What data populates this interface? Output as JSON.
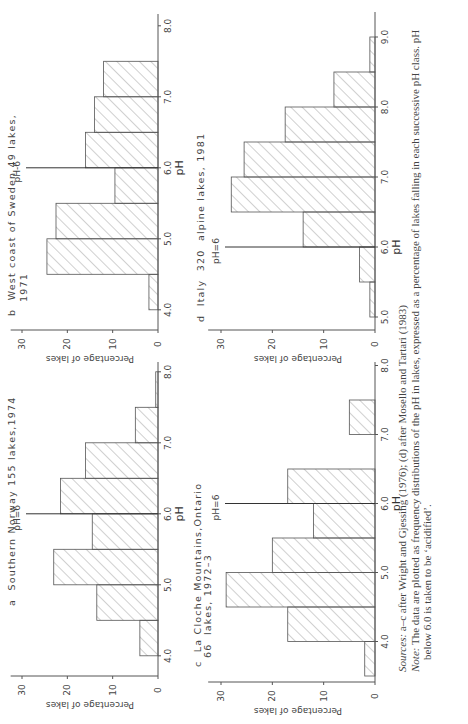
{
  "figure": {
    "orientation": "rotated 90 degrees counter-clockwise",
    "caption": {
      "sources_label": "Sources:",
      "sources_text": "a–c after Wright and Gjessing (1976); (d) after Mosello and Tartari (1983)",
      "note_label": "Note:",
      "note_text_line1": "The data are plotted as frequency distributions of the pH in lakes, expressed as a percentage of lakes falling in each successive pH class. pH",
      "note_text_line2": "below 6.0 is taken to be ‘acidified’."
    }
  },
  "chart_data": [
    {
      "id": "a",
      "type": "bar",
      "title": "a  Southern Norway 155 lakes,1974",
      "xlabel": "pH",
      "ylabel": "Percentage of lakes",
      "xticks": [
        "4.0",
        "5.0",
        "6.0",
        "7.0",
        "8.0"
      ],
      "yticks": [
        0,
        10,
        20,
        30
      ],
      "ylim": [
        0,
        32
      ],
      "xlim": [
        3.8,
        8.1
      ],
      "bin_width": 0.5,
      "annotation": "pH=6",
      "bins": [
        4.0,
        4.5,
        5.0,
        5.5,
        6.0,
        6.5,
        7.0,
        7.5
      ],
      "values": [
        4,
        13.5,
        23,
        14.5,
        21.5,
        16,
        5,
        0.5
      ]
    },
    {
      "id": "b",
      "type": "bar",
      "title": "b  West coast of Sweden 49 lakes,",
      "title_line2": "1971",
      "xlabel": "pH",
      "ylabel": "Percentage of lakes",
      "xticks": [
        "4.0",
        "5.0",
        "6.0",
        "7.0",
        "8.0"
      ],
      "yticks": [
        0,
        10,
        20,
        30
      ],
      "ylim": [
        0,
        32
      ],
      "xlim": [
        3.8,
        8.6
      ],
      "bin_width": 0.5,
      "annotation": "pH-6",
      "bins": [
        4.0,
        4.5,
        5.0,
        5.5,
        6.0,
        6.5,
        7.0
      ],
      "values": [
        2,
        24.5,
        22.5,
        9.5,
        16,
        14,
        12
      ]
    },
    {
      "id": "c",
      "type": "bar",
      "title": "c  La Cloche Mountains,Ontario",
      "title_line2": "66  lakes, 1972–3",
      "xlabel": "pH",
      "ylabel": "Percentage of lakes",
      "xticks": [
        "4.0",
        "5.0",
        "6.0",
        "7.0",
        "8.0"
      ],
      "yticks": [
        0,
        10,
        20,
        30
      ],
      "ylim": [
        0,
        32
      ],
      "xlim": [
        3.5,
        8.1
      ],
      "bin_width": 0.5,
      "annotation": "pH=6",
      "bins": [
        3.5,
        4.0,
        4.5,
        5.0,
        5.5,
        6.0,
        6.5,
        7.0
      ],
      "values": [
        2,
        17,
        29,
        20,
        12,
        17,
        0,
        5
      ]
    },
    {
      "id": "d",
      "type": "bar",
      "title": "d  Italy  320  alpine lakes, 1981",
      "xlabel": "pH",
      "ylabel": "Percentage of lakes",
      "xticks": [
        "5.0",
        "6.0",
        "7.0",
        "8.0",
        "9.0"
      ],
      "yticks": [
        0,
        10,
        20,
        30
      ],
      "ylim": [
        0,
        32
      ],
      "xlim": [
        4.9,
        9.1
      ],
      "bin_width": 0.5,
      "annotation": "pH=6",
      "bins": [
        5.0,
        5.5,
        6.0,
        6.5,
        7.0,
        7.5,
        8.0,
        8.5
      ],
      "values": [
        1,
        3,
        14,
        28,
        25.5,
        17.5,
        8,
        1
      ]
    }
  ]
}
